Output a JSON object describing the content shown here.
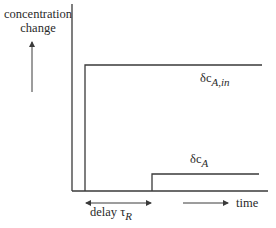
{
  "diagram": {
    "y_axis_label_line1": "concentration",
    "y_axis_label_line2": "change",
    "x_axis_label": "time",
    "delay_label_prefix": "delay ",
    "delay_symbol": "τ",
    "delay_subscript": "R",
    "input_step": {
      "symbol": "δc",
      "subscript": "A,in"
    },
    "output_step": {
      "symbol": "δc",
      "subscript": "A"
    },
    "colors": {
      "line": "#3a3a3a",
      "text": "#2a2a2a",
      "background": "#ffffff"
    }
  }
}
